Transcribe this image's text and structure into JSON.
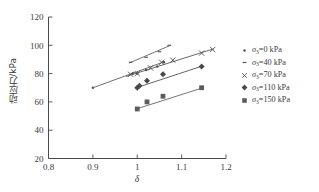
{
  "chart_data": {
    "type": "scatter",
    "title": "",
    "xlabel": "δ",
    "ylabel": "动应力/kPa",
    "xlim": [
      0.8,
      1.2
    ],
    "ylim": [
      20,
      120
    ],
    "xticks": [
      "0.8",
      "0.9",
      "1",
      "1.1",
      "1.2"
    ],
    "xtick_values": [
      0.8,
      0.9,
      1.0,
      1.1,
      1.2
    ],
    "yticks": [
      "20",
      "40",
      "60",
      "80",
      "100",
      "120"
    ],
    "ytick_values": [
      20,
      40,
      60,
      80,
      100,
      120
    ],
    "grid": false,
    "legend_position": "right",
    "series": [
      {
        "name": "σ₃=0 kPa",
        "label_prefix": "σ",
        "label_sub": "3",
        "label_suffix": "=0 kPa",
        "marker": "small-dot",
        "color": "#555555",
        "points": [
          {
            "x": 0.9,
            "y": 70.0
          },
          {
            "x": 0.99,
            "y": 80.0
          },
          {
            "x": 1.0,
            "y": 80.0
          },
          {
            "x": 1.02,
            "y": 82.5
          },
          {
            "x": 1.045,
            "y": 85.0
          },
          {
            "x": 1.06,
            "y": 88.0
          }
        ],
        "fit_line": {
          "x1": 0.9,
          "y1": 70.0,
          "x2": 1.062,
          "y2": 88.5
        }
      },
      {
        "name": "σ₃=40 kPa",
        "label_prefix": "σ",
        "label_sub": "3",
        "label_suffix": "=40 kPa",
        "marker": "tick-dash",
        "color": "#5a5a5a",
        "points": [
          {
            "x": 0.985,
            "y": 88.0
          },
          {
            "x": 1.02,
            "y": 91.5
          },
          {
            "x": 1.05,
            "y": 95.5
          },
          {
            "x": 1.072,
            "y": 100.0
          }
        ],
        "fit_line": {
          "x1": 0.982,
          "y1": 87.5,
          "x2": 1.075,
          "y2": 100.0
        }
      },
      {
        "name": "σ₃=70 kPa",
        "label_prefix": "σ",
        "label_sub": "3",
        "label_suffix": "=70 kPa",
        "marker": "cross-x",
        "color": "#4f4f4f",
        "points": [
          {
            "x": 0.985,
            "y": 79.5
          },
          {
            "x": 1.0,
            "y": 80.0
          },
          {
            "x": 1.03,
            "y": 84.0
          },
          {
            "x": 1.055,
            "y": 88.0
          },
          {
            "x": 1.08,
            "y": 89.5
          },
          {
            "x": 1.145,
            "y": 94.5
          },
          {
            "x": 1.17,
            "y": 97.0
          }
        ],
        "fit_line": {
          "x1": 0.975,
          "y1": 78.0,
          "x2": 1.172,
          "y2": 97.5
        }
      },
      {
        "name": "σ₃=110 kPa",
        "label_prefix": "σ",
        "label_sub": "3",
        "label_suffix": "=110 kPa",
        "marker": "filled-diamond",
        "color": "#4a4a4a",
        "points": [
          {
            "x": 1.0,
            "y": 70.0
          },
          {
            "x": 1.005,
            "y": 71.5
          },
          {
            "x": 1.022,
            "y": 75.0
          },
          {
            "x": 1.058,
            "y": 79.5
          },
          {
            "x": 1.145,
            "y": 85.0
          }
        ],
        "fit_line": {
          "x1": 0.998,
          "y1": 70.0,
          "x2": 1.148,
          "y2": 85.5
        }
      },
      {
        "name": "σ₃=150 kPa",
        "label_prefix": "σ",
        "label_sub": "3",
        "label_suffix": "=150 kPa",
        "marker": "filled-square",
        "color": "#5c5c5c",
        "points": [
          {
            "x": 1.0,
            "y": 55.0
          },
          {
            "x": 1.022,
            "y": 60.0
          },
          {
            "x": 1.058,
            "y": 64.0
          },
          {
            "x": 1.145,
            "y": 70.0
          }
        ],
        "fit_line": {
          "x1": 0.998,
          "y1": 55.0,
          "x2": 1.148,
          "y2": 70.0
        }
      }
    ]
  },
  "axis": {
    "xlabel": "δ",
    "ylabel": "动应力/kPa"
  }
}
